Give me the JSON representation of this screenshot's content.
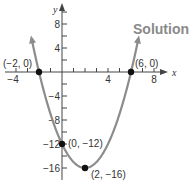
{
  "heading": "Solution",
  "chart_data": {
    "type": "line",
    "title": "",
    "function": "y = x^2 - 4x - 12",
    "xlabel": "x",
    "ylabel": "y",
    "xlim": [
      -5.3,
      8.8
    ],
    "ylim": [
      -17.5,
      11
    ],
    "x_ticks": [
      -4,
      -3,
      -2,
      -1,
      1,
      2,
      3,
      4,
      5,
      6,
      7,
      8
    ],
    "x_tick_labels": [
      {
        "value": -4,
        "label": "-4"
      },
      {
        "value": 4,
        "label": "4"
      },
      {
        "value": 8,
        "label": "8"
      }
    ],
    "y_ticks": [
      10,
      8,
      6,
      4,
      2,
      -2,
      -4,
      -6,
      -8,
      -10,
      -12,
      -14,
      -16
    ],
    "y_tick_labels": [
      {
        "value": 8,
        "label": "8"
      },
      {
        "value": 4,
        "label": "4"
      },
      {
        "value": -4,
        "label": "-4"
      },
      {
        "value": -8,
        "label": "-8"
      },
      {
        "value": -12,
        "label": "-12"
      },
      {
        "value": -16,
        "label": "-16"
      }
    ],
    "grid": false,
    "curve_color": "#8c8c8c",
    "points": [
      {
        "x": -2,
        "y": 0,
        "label": "(−2, 0)"
      },
      {
        "x": 6,
        "y": 0,
        "label": "(6, 0)"
      },
      {
        "x": 0,
        "y": -12,
        "label": "(0, −12)"
      },
      {
        "x": 2,
        "y": -16,
        "label": "(2, −16)"
      }
    ],
    "curve_domain": [
      -2.65,
      6.65
    ]
  }
}
